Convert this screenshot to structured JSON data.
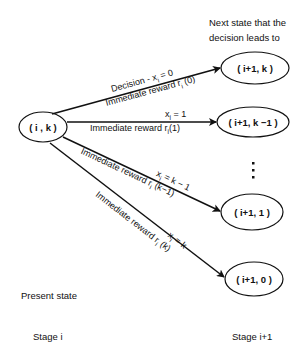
{
  "header": {
    "line1": "Next state that the",
    "line2": "decision leads to"
  },
  "source_node": {
    "label": "( i , k )"
  },
  "target_nodes": [
    {
      "label": "( i+1, k )"
    },
    {
      "label": "( i+1, k −1 )"
    },
    {
      "label": "( i+1, 1 )"
    },
    {
      "label": "( i+1, 0 )"
    }
  ],
  "ellipsis": "⋮",
  "edges": [
    {
      "decision": "Decision - x",
      "decision_sub": "i",
      "decision_val": " = 0",
      "reward": "Immediate  reward  r",
      "reward_sub": "i",
      "reward_arg": " (0)"
    },
    {
      "decision": "x",
      "decision_sub": "i",
      "decision_val": " = 1",
      "reward": "Immediate  reward  r",
      "reward_sub": "i",
      "reward_arg": "(1)"
    },
    {
      "decision": "x",
      "decision_sub": "i",
      "decision_val": " = k − 1",
      "reward": "Immediate  reward  r",
      "reward_sub": "i",
      "reward_arg": " (k−1)"
    },
    {
      "decision": "x",
      "decision_sub": "i",
      "decision_val": " = k",
      "reward": "Immediate  reward  r",
      "reward_sub": "i",
      "reward_arg": " (k)"
    }
  ],
  "footer": {
    "present_state": "Present state",
    "stage_left": "Stage  i",
    "stage_right": "Stage  i+1"
  }
}
